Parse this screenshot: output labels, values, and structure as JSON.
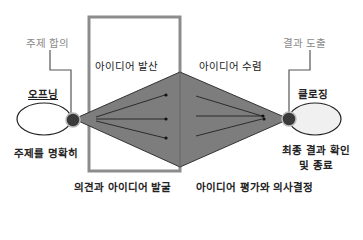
{
  "diagram": {
    "top_labels": {
      "topic_agreement": "주제 합의",
      "result_derivation": "결과 도출"
    },
    "phases": {
      "divergence": "아이디어 발산",
      "convergence": "아이디어 수렴"
    },
    "endpoints": {
      "opening": "오프닝",
      "opening_desc": "주제를 명확히",
      "closing": "클로징",
      "closing_desc_line1": "최종 결과 확인",
      "closing_desc_line2": "및 종료"
    },
    "bottom_labels": {
      "divergence_desc": "의견과 아이디어 발굴",
      "convergence_desc": "아이디어 평가와 의사결정"
    },
    "colors": {
      "diamond_fill": "#7d7d7d",
      "box_border": "#8c8c8c",
      "node_fill": "#3a3a3a",
      "ellipse_fill_right": "#f0f0f0",
      "muted_text": "#8a8a8a"
    }
  }
}
